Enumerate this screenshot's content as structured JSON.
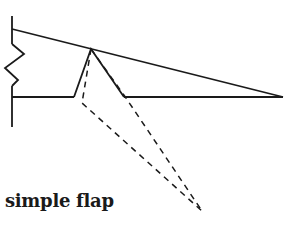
{
  "diagram": {
    "caption": "simple flap",
    "stroke_color": "#1a1a1a",
    "background": "#ffffff",
    "elements": {
      "wall": {
        "x": 12,
        "y1": 16,
        "y2": 127
      },
      "spring_zigzag": [
        [
          12,
          44
        ],
        [
          24,
          54
        ],
        [
          5,
          68
        ],
        [
          18,
          80
        ],
        [
          12,
          86
        ]
      ],
      "upper_surface": {
        "from": [
          12,
          29
        ],
        "to": [
          283,
          97
        ]
      },
      "lower_surface": {
        "from": [
          12,
          97
        ],
        "to": [
          283,
          97
        ]
      },
      "flap_hinge_point": [
        91,
        49
      ],
      "flap_left_edge": {
        "from": [
          74,
          97
        ],
        "to": [
          91,
          49
        ]
      },
      "flap_right_edge": {
        "from": [
          91,
          49
        ],
        "to": [
          124,
          97
        ]
      },
      "deflected_flap_left_dashed": [
        [
          91,
          49
        ],
        [
          82,
          103
        ],
        [
          202,
          211
        ]
      ],
      "deflected_flap_right_dashed": [
        [
          91,
          49
        ],
        [
          126,
          98
        ],
        [
          202,
          211
        ]
      ]
    }
  }
}
